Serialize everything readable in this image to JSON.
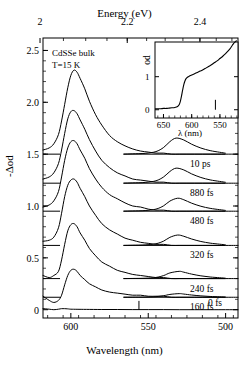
{
  "figure": {
    "top_axis_title": "Energy (eV)",
    "bottom_axis_title": "Wavelength (nm)",
    "y_axis_title": "-Δod",
    "annotation_sample": "CdSSe bulk",
    "annotation_temperature": "T=15 K"
  },
  "inset": {
    "y_axis_title": "od",
    "x_axis_title": "λ (nm)",
    "x_ticks": [
      "650",
      "600",
      "550"
    ],
    "y_ticks": [
      "0",
      "1"
    ]
  },
  "axes": {
    "top_ticks": [
      "2",
      "2.2",
      "2.4",
      "2.6"
    ],
    "bottom_ticks": [
      "600",
      "550",
      "500"
    ],
    "y_ticks": [
      "0",
      "0.5",
      "1.0",
      "1.5",
      "2.0",
      "2.5"
    ]
  },
  "trace_labels": [
    {
      "label": "10 ps"
    },
    {
      "label": "880 fs"
    },
    {
      "label": "480 fs"
    },
    {
      "label": "320 fs"
    },
    {
      "label": "240 fs"
    },
    {
      "label": "160 fs"
    },
    {
      "label": "0 fs"
    }
  ],
  "chart_data": {
    "type": "line",
    "title": "",
    "xlabel": "Wavelength (nm)",
    "ylabel": "-Δod",
    "xlabel_top": "Energy (eV)",
    "xlim": [
      618,
      492
    ],
    "ylim": [
      -0.08,
      2.62
    ],
    "grid": false,
    "legend": "right-inline",
    "x_ticks_bottom": [
      600,
      550,
      500
    ],
    "x_ticks_top_eV": [
      2,
      2.2,
      2.4,
      2.6
    ],
    "y_ticks": [
      0,
      0.5,
      1.0,
      1.5,
      2.0,
      2.5
    ],
    "note": "Transient absorption (-delta od) spectra of CdSSe bulk at T=15 K for seven pump-probe delays; each trace is vertically offset by its baseline. The short-wavelength (~530 nm) feature is shown magnified on the same baseline.",
    "series": [
      {
        "name": "10 ps",
        "baseline": 1.5,
        "x": [
          618,
          614,
          611,
          608,
          606,
          604,
          602,
          600,
          598,
          596,
          594,
          591,
          588,
          584,
          580,
          575,
          570,
          565,
          560,
          555,
          550,
          545,
          540,
          535,
          530,
          525,
          520,
          515,
          510,
          505,
          500,
          496,
          492
        ],
        "y": [
          1.54,
          1.56,
          1.6,
          1.69,
          1.82,
          1.98,
          2.14,
          2.26,
          2.31,
          2.29,
          2.23,
          2.13,
          2.01,
          1.88,
          1.78,
          1.68,
          1.62,
          1.58,
          1.55,
          1.53,
          1.52,
          1.51,
          1.51,
          1.5,
          1.5,
          1.5,
          1.5,
          1.5,
          1.5,
          1.5,
          1.5,
          1.5,
          1.5
        ]
      },
      {
        "name": "880 fs",
        "baseline": 1.22,
        "x": [
          618,
          614,
          611,
          608,
          606,
          604,
          602,
          600,
          598,
          596,
          594,
          591,
          588,
          584,
          580,
          575,
          570,
          565,
          560,
          555,
          550,
          545,
          540,
          535,
          530,
          525,
          520,
          515,
          510,
          505,
          500,
          496,
          492
        ],
        "y": [
          1.26,
          1.28,
          1.32,
          1.41,
          1.54,
          1.7,
          1.84,
          1.91,
          1.92,
          1.89,
          1.83,
          1.74,
          1.64,
          1.53,
          1.44,
          1.37,
          1.32,
          1.29,
          1.26,
          1.25,
          1.24,
          1.23,
          1.23,
          1.22,
          1.22,
          1.22,
          1.22,
          1.22,
          1.22,
          1.22,
          1.22,
          1.22,
          1.22
        ]
      },
      {
        "name": "480 fs",
        "baseline": 0.95,
        "x": [
          618,
          614,
          611,
          608,
          606,
          604,
          602,
          600,
          598,
          596,
          594,
          591,
          588,
          584,
          580,
          575,
          570,
          565,
          560,
          555,
          550,
          545,
          540,
          535,
          530,
          525,
          520,
          515,
          510,
          505,
          500,
          496,
          492
        ],
        "y": [
          0.99,
          1.01,
          1.05,
          1.14,
          1.28,
          1.44,
          1.56,
          1.62,
          1.63,
          1.6,
          1.54,
          1.46,
          1.36,
          1.26,
          1.18,
          1.11,
          1.07,
          1.03,
          1.0,
          0.99,
          0.97,
          0.96,
          0.96,
          0.95,
          0.95,
          0.95,
          0.95,
          0.95,
          0.95,
          0.95,
          0.95,
          0.95,
          0.95
        ]
      },
      {
        "name": "320 fs",
        "baseline": 0.62,
        "x": [
          618,
          614,
          611,
          608,
          606,
          604,
          602,
          600,
          598,
          596,
          594,
          591,
          588,
          584,
          580,
          575,
          570,
          565,
          560,
          555,
          550,
          545,
          540,
          535,
          530,
          525,
          520,
          515,
          510,
          505,
          500,
          496,
          492
        ],
        "y": [
          0.66,
          0.67,
          0.7,
          0.79,
          0.93,
          1.09,
          1.2,
          1.25,
          1.26,
          1.23,
          1.17,
          1.09,
          1.0,
          0.91,
          0.83,
          0.77,
          0.73,
          0.69,
          0.67,
          0.65,
          0.64,
          0.63,
          0.63,
          0.62,
          0.62,
          0.62,
          0.62,
          0.62,
          0.62,
          0.62,
          0.62,
          0.62,
          0.62
        ]
      },
      {
        "name": "240 fs",
        "baseline": 0.3,
        "x": [
          618,
          614,
          611,
          608,
          606,
          604,
          602,
          600,
          598,
          596,
          594,
          591,
          588,
          584,
          580,
          575,
          570,
          565,
          560,
          555,
          550,
          545,
          540,
          535,
          530,
          525,
          520,
          515,
          510,
          505,
          500,
          496,
          492
        ],
        "y": [
          0.33,
          0.31,
          0.33,
          0.37,
          0.48,
          0.63,
          0.76,
          0.82,
          0.83,
          0.8,
          0.74,
          0.67,
          0.59,
          0.52,
          0.46,
          0.42,
          0.38,
          0.36,
          0.34,
          0.33,
          0.32,
          0.31,
          0.31,
          0.3,
          0.3,
          0.3,
          0.3,
          0.3,
          0.3,
          0.3,
          0.3,
          0.3,
          0.3
        ]
      },
      {
        "name": "160 fs",
        "baseline": 0.12,
        "x": [
          618,
          614,
          611,
          608,
          606,
          604,
          602,
          600,
          598,
          596,
          594,
          591,
          588,
          584,
          580,
          575,
          570,
          565,
          560,
          555,
          550,
          545,
          540,
          535,
          530,
          525,
          520,
          515,
          510,
          505,
          500,
          496,
          492
        ],
        "y": [
          0.13,
          0.09,
          0.07,
          0.09,
          0.14,
          0.24,
          0.33,
          0.38,
          0.39,
          0.37,
          0.33,
          0.29,
          0.25,
          0.22,
          0.19,
          0.17,
          0.16,
          0.15,
          0.14,
          0.14,
          0.13,
          0.13,
          0.13,
          0.12,
          0.12,
          0.12,
          0.12,
          0.12,
          0.12,
          0.12,
          0.12,
          0.12,
          0.12
        ]
      },
      {
        "name": "0 fs",
        "baseline": 0.0,
        "x": [
          618,
          614,
          611,
          608,
          606,
          604,
          602,
          600,
          596,
          590,
          580,
          570,
          560,
          550,
          540,
          530,
          520,
          510,
          500,
          492
        ],
        "y": [
          0.01,
          0.005,
          0.0,
          0.005,
          0.01,
          0.01,
          0.008,
          0.005,
          0.004,
          0.003,
          0.002,
          0.002,
          0.001,
          0.001,
          0.001,
          0.0,
          0.0,
          0.0,
          0.0,
          0.0
        ]
      }
    ],
    "magnified_features": [
      {
        "name": "10 ps",
        "baseline": 1.5,
        "peak_wavelength": 532,
        "peak_height": 0.155,
        "x_start": 566,
        "x_end": 500
      },
      {
        "name": "880 fs",
        "baseline": 1.22,
        "peak_wavelength": 532,
        "peak_height": 0.145,
        "x_start": 566,
        "x_end": 500
      },
      {
        "name": "480 fs",
        "baseline": 0.95,
        "peak_wavelength": 531,
        "peak_height": 0.125,
        "x_start": 566,
        "x_end": 500
      },
      {
        "name": "320 fs",
        "baseline": 0.62,
        "peak_wavelength": 531,
        "peak_height": 0.1,
        "x_start": 566,
        "x_end": 500
      },
      {
        "name": "240 fs",
        "baseline": 0.3,
        "peak_wavelength": 530,
        "peak_height": 0.07,
        "x_start": 566,
        "x_end": 500
      },
      {
        "name": "160 fs",
        "baseline": 0.12,
        "peak_wavelength": 530,
        "peak_height": 0.035,
        "x_start": 566,
        "x_end": 500
      }
    ],
    "inset_chart": {
      "type": "line",
      "xlabel": "λ (nm)",
      "ylabel": "od",
      "xlim": [
        665,
        518
      ],
      "ylim": [
        -0.25,
        2.05
      ],
      "x_ticks": [
        650,
        600,
        550
      ],
      "y_ticks": [
        0,
        1
      ],
      "x": [
        665,
        660,
        655,
        650,
        645,
        640,
        635,
        630,
        625,
        622,
        620,
        618,
        616,
        614,
        612,
        610,
        607,
        604,
        600,
        595,
        590,
        585,
        580,
        575,
        570,
        565,
        560,
        555,
        550,
        545,
        540,
        535,
        532,
        530,
        528,
        526,
        524,
        522,
        520
      ],
      "y": [
        0.03,
        0.03,
        0.03,
        0.04,
        0.04,
        0.05,
        0.06,
        0.07,
        0.1,
        0.16,
        0.26,
        0.42,
        0.6,
        0.76,
        0.87,
        0.94,
        0.99,
        1.02,
        1.05,
        1.09,
        1.13,
        1.17,
        1.21,
        1.26,
        1.31,
        1.36,
        1.42,
        1.48,
        1.55,
        1.62,
        1.7,
        1.79,
        1.85,
        1.9,
        1.95,
        2.0,
        2.04,
        2.07,
        2.09
      ]
    }
  }
}
